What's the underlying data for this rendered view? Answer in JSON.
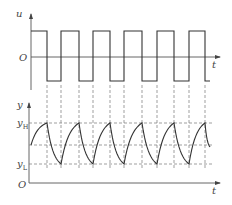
{
  "top_plot": {
    "y_axis_label": "u",
    "x_axis_label": "t",
    "origin_label": "O",
    "signal": "square wave",
    "edges": {
      "falling": [
        1,
        3,
        5,
        7,
        9,
        11
      ],
      "rising": [
        2,
        4,
        6,
        8,
        10
      ]
    }
  },
  "bottom_plot": {
    "y_axis_label": "y",
    "y_high_label": "y",
    "y_high_sub": "H",
    "y_low_label": "y",
    "y_low_sub": "L",
    "x_axis_label": "t",
    "origin_label": "O",
    "signal": "exponential charge/discharge between yH and yL"
  },
  "colors": {
    "line": "#333333",
    "dash": "#777777",
    "text": "#444444"
  }
}
